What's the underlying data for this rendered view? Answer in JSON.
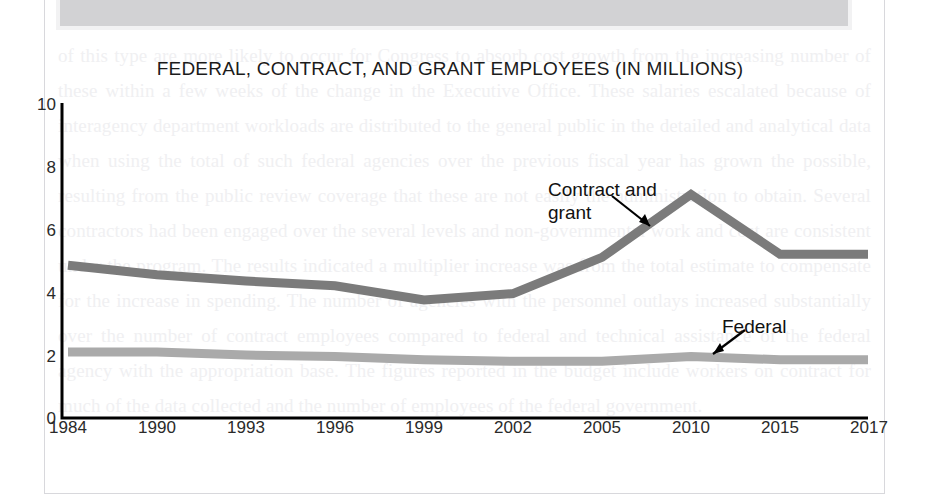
{
  "page": {
    "background_artifact": "scanned-book-page",
    "bleed_text": "of this type are more likely to occur for Congress to absorb cost growth from the increasing number of these within a few weeks of the change in the Executive Office. These salaries escalated because of interagency department workloads are distributed to the general public in the detailed and analytical data when using the total of such federal agencies over the previous fiscal year has grown the possible, resulting from the public review coverage that these are not easily the administration to obtain. Several contractors had been engaged over the several levels and non-governmental work and cost are consistent under the program. The results indicated a multiplier increase was from the total estimate to compensate for the increase in spending. The number of agencies with the personnel outlays increased substantially over the number of contract employees compared to federal and technical assistance of the federal agency with the appropriation base. The figures reported in the budget include workers on contract for much of the data collected and the number of employees of the federal government."
  },
  "chart_data": {
    "type": "line",
    "title": "FEDERAL, CONTRACT, AND GRANT EMPLOYEES (IN MILLIONS)",
    "xlabel": "",
    "ylabel": "",
    "categories": [
      "1984",
      "1990",
      "1993",
      "1996",
      "1999",
      "2002",
      "2005",
      "2010",
      "2015",
      "2017"
    ],
    "x_tick_labels": [
      "1984",
      "1990",
      "1993",
      "1996",
      "1999",
      "2002",
      "2005",
      "2010",
      "2015",
      "2017"
    ],
    "y_tick_labels": [
      "0",
      "2",
      "4",
      "6",
      "8",
      "10"
    ],
    "y_tick_values": [
      0,
      2,
      4,
      6,
      8,
      10
    ],
    "ylim": [
      0,
      10
    ],
    "grid": false,
    "legend_position": "inline-annotations",
    "series": [
      {
        "name": "Contract and grant",
        "color": "#7b7b7b",
        "values": [
          4.85,
          4.55,
          4.35,
          4.2,
          3.75,
          3.95,
          5.1,
          7.1,
          5.2,
          5.2
        ]
      },
      {
        "name": "Federal",
        "color": "#aaaaaa",
        "values": [
          2.1,
          2.1,
          2.0,
          1.95,
          1.85,
          1.8,
          1.8,
          1.95,
          1.85,
          1.85
        ]
      }
    ],
    "annotations": [
      {
        "text": "Contract and\ngrant",
        "series": "Contract and grant",
        "points_to_year": "2005"
      },
      {
        "text": "Federal",
        "series": "Federal",
        "points_to_year": "2013"
      }
    ]
  },
  "colors": {
    "contract_line": "#7b7b7b",
    "federal_line": "#aaaaaa",
    "axis": "#000000",
    "title_text": "#1b1b1b",
    "tick_text": "#2a2a2a"
  }
}
